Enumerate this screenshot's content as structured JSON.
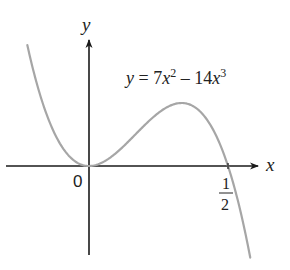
{
  "chart_data": {
    "type": "line",
    "title": "",
    "equation_label": {
      "lhs": "y",
      "eq": " = 7",
      "x1": "x",
      "exp1": "2",
      "minus": " – 14",
      "x2": "x",
      "exp2": "3",
      "full": "y = 7x^2 - 14x^3"
    },
    "function": {
      "a2": 7,
      "a3": -14
    },
    "xlabel": "x",
    "ylabel": "y",
    "origin_label": "0",
    "x_tick": {
      "value": 0.5,
      "numerator": "1",
      "denominator": "2"
    },
    "series": [
      {
        "name": "y = 7x^2 - 14x^3",
        "x_domain": [
          -0.23,
          0.58
        ],
        "color": "#a6a6a6",
        "notable_points": [
          {
            "x": 0,
            "y": 0,
            "note": "local minimum / root"
          },
          {
            "x": 0.3333,
            "y": 0.2593,
            "note": "local maximum"
          },
          {
            "x": 0.5,
            "y": 0,
            "note": "root"
          }
        ]
      }
    ],
    "grid": false,
    "legend": "none",
    "axis_color": "#1a1a1a"
  }
}
